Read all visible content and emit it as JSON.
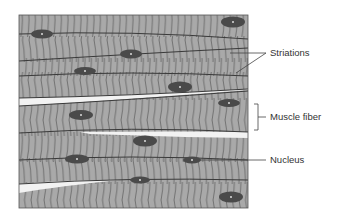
{
  "colors": {
    "tissue": "#a8a8a8",
    "striation": "#5a5a5a",
    "boundary": "#3a3a3a",
    "nucleus": "#4a4a4a",
    "nucleus_dot": "#d8d8d8",
    "gap": "#f2f2f2",
    "label_text": "#333333",
    "leader_line": "#444444"
  },
  "labels": {
    "striations": "Striations",
    "muscle_fiber": "Muscle fiber",
    "nucleus": "Nucleus"
  }
}
